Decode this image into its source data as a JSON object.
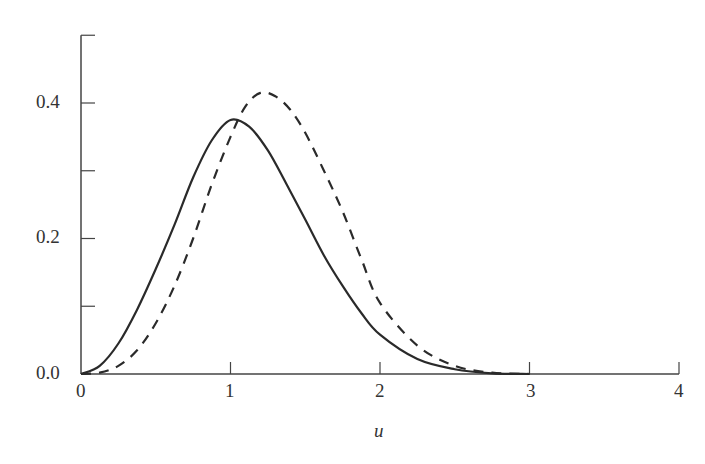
{
  "chart_data": {
    "type": "line",
    "title": "",
    "xlabel": "u",
    "ylabel": "",
    "xlim": [
      0,
      4
    ],
    "ylim": [
      0,
      0.5
    ],
    "x_ticks": [
      "0",
      "1",
      "2",
      "3",
      "4"
    ],
    "y_ticks": [
      "0.0",
      "0.2",
      "0.4"
    ],
    "grid": false,
    "legend": null,
    "series": [
      {
        "name": "solid",
        "style": "solid",
        "x": [
          0,
          0.125,
          0.25,
          0.375,
          0.5,
          0.625,
          0.75,
          0.875,
          1.0,
          1.125,
          1.25,
          1.375,
          1.5,
          1.625,
          1.75,
          1.875,
          2.0,
          2.25,
          2.5,
          2.75,
          3.0
        ],
        "y": [
          0,
          0.012,
          0.045,
          0.095,
          0.155,
          0.22,
          0.29,
          0.345,
          0.375,
          0.365,
          0.33,
          0.28,
          0.228,
          0.175,
          0.13,
          0.09,
          0.058,
          0.022,
          0.007,
          0.001,
          0
        ]
      },
      {
        "name": "dashed",
        "style": "dashed",
        "x": [
          0,
          0.125,
          0.25,
          0.375,
          0.5,
          0.625,
          0.75,
          0.875,
          1.0,
          1.1,
          1.2,
          1.3,
          1.4,
          1.5,
          1.625,
          1.75,
          1.875,
          2.0,
          2.25,
          2.5,
          2.75,
          3.0
        ],
        "y": [
          0,
          0.002,
          0.012,
          0.035,
          0.075,
          0.13,
          0.2,
          0.28,
          0.35,
          0.395,
          0.415,
          0.41,
          0.39,
          0.356,
          0.3,
          0.24,
          0.17,
          0.105,
          0.042,
          0.012,
          0.002,
          0
        ]
      }
    ]
  },
  "axes": {
    "x_tick_labels": [
      "0",
      "1",
      "2",
      "3",
      "4"
    ],
    "y_tick_labels": [
      "0.0",
      "0.2",
      "0.4"
    ],
    "x_label": "u"
  }
}
